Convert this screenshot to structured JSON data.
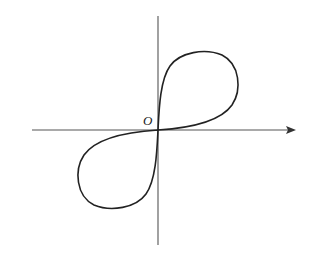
{
  "diagram": {
    "type": "parametric-curve-figure-eight",
    "origin_label": "O",
    "axes": {
      "x_axis": {
        "has_arrow": true,
        "direction": "right"
      },
      "y_axis": {
        "has_arrow": false
      }
    },
    "colors": {
      "background": "#ffffff",
      "axis": "#555555",
      "curve": "#222222"
    }
  }
}
